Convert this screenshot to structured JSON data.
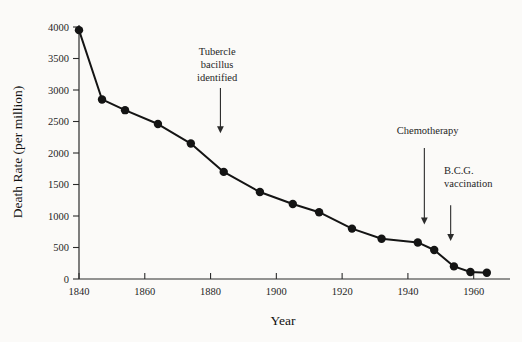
{
  "chart_data": {
    "type": "line",
    "title": "",
    "xlabel": "Year",
    "ylabel": "Death Rate (per million)",
    "xlim": [
      1840,
      1968
    ],
    "ylim": [
      0,
      4000
    ],
    "xticks": [
      1840,
      1860,
      1880,
      1900,
      1920,
      1940,
      1960
    ],
    "yticks": [
      0,
      500,
      1000,
      1500,
      2000,
      2500,
      3000,
      3500,
      4000
    ],
    "grid": false,
    "legend": null,
    "marker": "filled-circle",
    "series": [
      {
        "name": "Tuberculosis death rate",
        "x": [
          1840,
          1847,
          1854,
          1864,
          1874,
          1884,
          1895,
          1905,
          1913,
          1923,
          1932,
          1943,
          1948,
          1954,
          1959,
          1964
        ],
        "values": [
          3950,
          2850,
          2680,
          2460,
          2150,
          1700,
          1380,
          1190,
          1060,
          800,
          640,
          580,
          460,
          200,
          110,
          100
        ]
      }
    ],
    "annotations": [
      {
        "name": "tubercle-bacillus-identified",
        "lines": [
          "Tubercle",
          "bacillus",
          "identified"
        ],
        "point_year": 1883,
        "text_x": 1882,
        "text_top_y": 3560,
        "arrow_from_y": 3030,
        "arrow_to_y": 2330
      },
      {
        "name": "chemotherapy",
        "lines": [
          "Chemotherapy"
        ],
        "point_year": 1945,
        "text_x": 1946,
        "text_top_y": 2300,
        "arrow_from_y": 2080,
        "arrow_to_y": 880
      },
      {
        "name": "bcg-vaccination",
        "lines": [
          "B.C.G.",
          "vaccination"
        ],
        "point_year": 1953,
        "text_x": 1951,
        "text_top_y": 1660,
        "arrow_from_y": 1170,
        "arrow_to_y": 620
      }
    ]
  }
}
